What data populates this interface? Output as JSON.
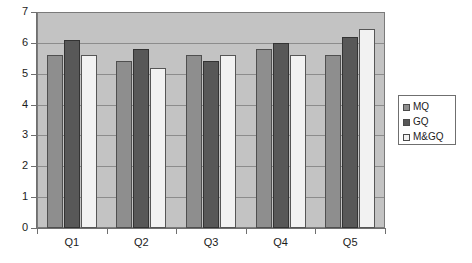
{
  "chart_data": {
    "type": "bar",
    "title": "",
    "subtitle": "",
    "xlabel": "",
    "ylabel": "",
    "categories": [
      "Q1",
      "Q2",
      "Q3",
      "Q4",
      "Q5"
    ],
    "series": [
      {
        "name": "MQ",
        "color": "#8e8e8e",
        "values": [
          5.6,
          5.4,
          5.6,
          5.8,
          5.6
        ]
      },
      {
        "name": "GQ",
        "color": "#585858",
        "values": [
          6.1,
          5.8,
          5.4,
          6.0,
          6.2
        ]
      },
      {
        "name": "M&GQ",
        "color": "#f2f2f2",
        "values": [
          5.6,
          5.2,
          5.6,
          5.6,
          6.45
        ]
      }
    ],
    "ylim": [
      0,
      7
    ],
    "yticks": [
      0,
      1,
      2,
      3,
      4,
      5,
      6,
      7
    ],
    "ytick_labels": [
      "0",
      "1",
      "2",
      "3",
      "4",
      "5",
      "6",
      "7"
    ],
    "grid": true,
    "grid_axis": "y",
    "legend_position": "right",
    "plot_background": "#c3c3c3"
  },
  "legend": {
    "entries": [
      {
        "label": "MQ"
      },
      {
        "label": "GQ"
      },
      {
        "label": "M&GQ"
      }
    ]
  }
}
